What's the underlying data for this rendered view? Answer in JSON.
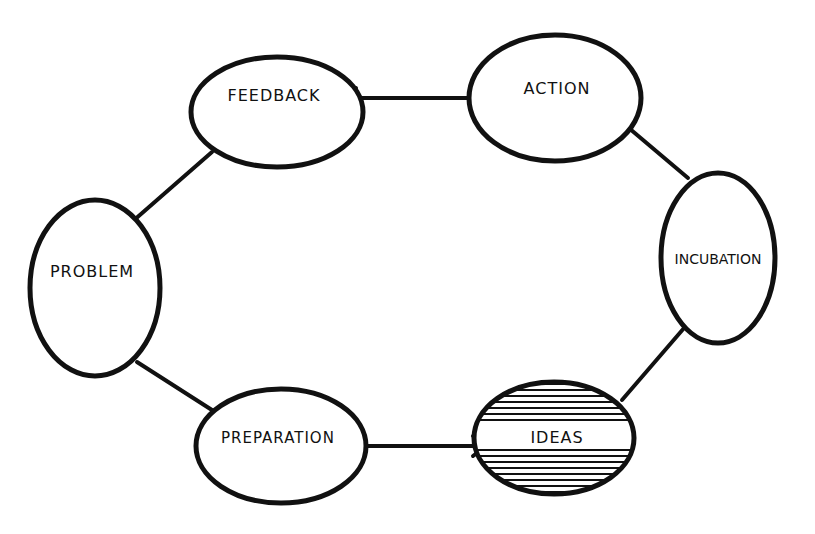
{
  "diagram": {
    "colors": {
      "ink": "#111111",
      "background": "#ffffff"
    },
    "nodes": [
      {
        "id": "feedback",
        "label": "FEEDBACK",
        "hatched": false
      },
      {
        "id": "action",
        "label": "ACTION",
        "hatched": false
      },
      {
        "id": "incubation",
        "label": "INCUBATION",
        "hatched": false
      },
      {
        "id": "ideas",
        "label": "IDEAS",
        "hatched": true
      },
      {
        "id": "preparation",
        "label": "PREPARATION",
        "hatched": false
      },
      {
        "id": "problem",
        "label": "PROBLEM",
        "hatched": false
      }
    ],
    "edges": [
      {
        "from": "action",
        "to": "feedback"
      },
      {
        "from": "feedback",
        "to": "problem"
      },
      {
        "from": "problem",
        "to": "preparation"
      },
      {
        "from": "preparation",
        "to": "ideas"
      },
      {
        "from": "ideas",
        "to": "incubation"
      },
      {
        "from": "incubation",
        "to": "action"
      }
    ]
  }
}
